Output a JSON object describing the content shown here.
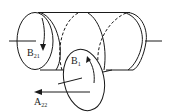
{
  "diagram": {
    "type": "technical-illustration",
    "colors": {
      "stroke": "#1a1a1a",
      "background": "#ffffff"
    },
    "labels": {
      "b21": {
        "main": "B",
        "sub": "21"
      },
      "b1": {
        "main": "B",
        "sub": "1"
      },
      "a22": {
        "main": "A",
        "sub": "22"
      }
    }
  }
}
